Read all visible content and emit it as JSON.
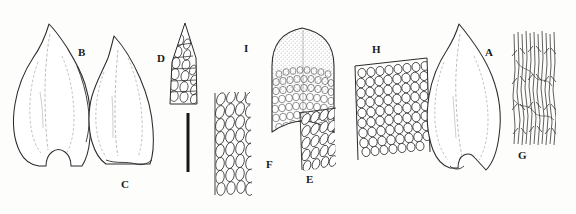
{
  "figure": {
    "type": "scientific-illustration",
    "background_color": "#fdfdfc",
    "ink_color": "#1a1a1a",
    "width": 576,
    "height": 214
  },
  "panels": [
    {
      "id": "B",
      "label": "B",
      "name": "panel-b-leaf",
      "kind": "whole-leaf",
      "description": "ovate-lanceolate leaf with acuminate apex and notched concave base",
      "label_x": 78,
      "label_y": 47
    },
    {
      "id": "C",
      "label": "C",
      "name": "panel-c-leaf",
      "kind": "whole-leaf",
      "description": "asymmetric lanceolate leaf with curved acuminate apex",
      "label_x": 121,
      "label_y": 179
    },
    {
      "id": "D",
      "label": "D",
      "name": "panel-d-leaf-apex",
      "kind": "leaf-apex-cells",
      "description": "narrow triangular leaf apex showing elongate apical cells",
      "label_x": 157,
      "label_y": 53
    },
    {
      "id": "I",
      "label": "I",
      "name": "panel-i-calyptra",
      "kind": "dome-structure",
      "description": "dome-shaped structure densely filled with small isodiametric cells",
      "label_x": 244,
      "label_y": 43
    },
    {
      "id": "F",
      "label": "F",
      "name": "panel-f-cells",
      "kind": "cell-patch",
      "description": "patch of oblong laminal cells in oblique rows",
      "label_x": 266,
      "label_y": 159
    },
    {
      "id": "E",
      "label": "E",
      "name": "panel-e-cells",
      "kind": "cell-patch",
      "description": "small patch of oval cells in diagonal rows",
      "label_x": 306,
      "label_y": 174
    },
    {
      "id": "H",
      "label": "H",
      "name": "panel-h-cells",
      "kind": "cell-patch",
      "description": "dense patch of rounded quadrate cells",
      "label_x": 372,
      "label_y": 44
    },
    {
      "id": "A",
      "label": "A",
      "name": "panel-a-leaf",
      "kind": "whole-leaf",
      "description": "broadly ovate leaf with short apiculate apex and notched base",
      "label_x": 485,
      "label_y": 47
    },
    {
      "id": "G",
      "label": "G",
      "name": "panel-g-cells",
      "kind": "cell-patch",
      "description": "very elongate linear fibrous cells",
      "label_x": 518,
      "label_y": 150
    }
  ],
  "scale_bar": {
    "name": "scale-bar",
    "orientation": "vertical",
    "x": 188,
    "y_top": 113,
    "y_bottom": 172,
    "thickness": 3,
    "color": "#171717"
  }
}
